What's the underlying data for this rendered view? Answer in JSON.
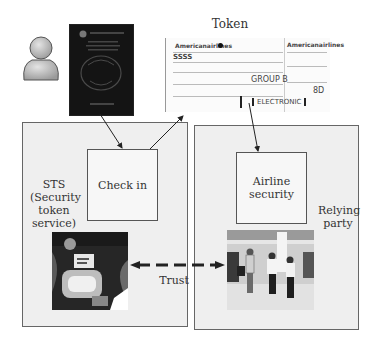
{
  "title": "Token",
  "user": {
    "icon": "person-icon"
  },
  "passport": {
    "icon": "passport-icon"
  },
  "ticket": {
    "icon": "boarding-pass-icon",
    "airline_left": "Americanairlines",
    "airline_right": "Americanairlines",
    "group": "GROUP B",
    "electronic": "ELECTRONIC",
    "seat": "8D",
    "code": "SSSS"
  },
  "left_panel": {
    "label_lines": [
      "STS",
      "(Security",
      "token",
      "service)"
    ],
    "inner_box": {
      "label": "Check in"
    },
    "photo": "check-in-kiosk-photo"
  },
  "right_panel": {
    "label_lines": [
      "Relying",
      "party"
    ],
    "inner_box": {
      "label_lines": [
        "Airline",
        "security"
      ]
    },
    "photo": "security-checkpoint-photo"
  },
  "trust": {
    "label": "Trust"
  },
  "colors": {
    "panel_bg": "#efefef",
    "border": "#555555",
    "arrow": "#222222"
  }
}
